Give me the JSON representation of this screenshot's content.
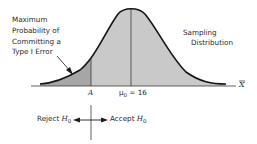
{
  "diagram": {
    "type": "sampling-distribution-hypothesis-test",
    "annotation": {
      "lines": [
        "Maximum",
        "Probability of",
        "Committing a",
        "Type I Error"
      ]
    },
    "curve_label": {
      "lines": [
        "Sampling",
        "Distribution"
      ]
    },
    "axis": {
      "variable_label": "X",
      "critical_value_label": "A",
      "mean_label": "μ",
      "mean_subscript": "0",
      "mean_value_text": " = 16"
    },
    "decision": {
      "reject_text": "Reject ",
      "accept_text": "Accept ",
      "hypothesis_symbol": "H",
      "hypothesis_subscript": "0"
    },
    "colors": {
      "body_fill": "#c9c9c9",
      "tail_fill": "#a6a6a6",
      "stroke": "#151515",
      "text": "#2a2a2a"
    }
  }
}
